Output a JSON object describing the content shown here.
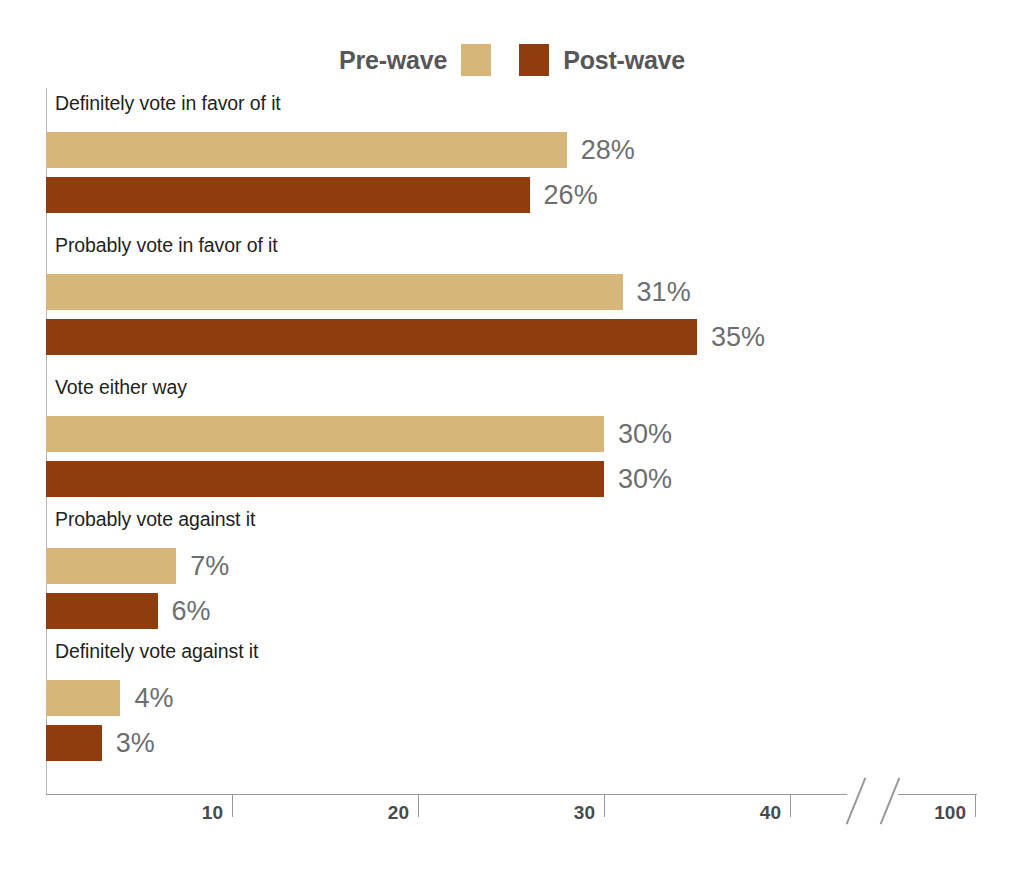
{
  "legend": {
    "pre_label": "Pre-wave",
    "post_label": "Post-wave",
    "pre_color": "#d6b679",
    "post_color": "#8f3d0e"
  },
  "chart_data": {
    "type": "bar",
    "orientation": "horizontal",
    "title": "",
    "xlabel": "",
    "ylabel": "",
    "grid": false,
    "legend_position": "top-center",
    "xlim": [
      0,
      100
    ],
    "axis_break": {
      "from": 42,
      "to": 96
    },
    "ticks": [
      10,
      20,
      30,
      40,
      100
    ],
    "tick_labels": [
      "10",
      "20",
      "30",
      "40",
      "100"
    ],
    "categories": [
      "Definitely vote in favor of it",
      "Probably vote in favor of it",
      "Vote either way",
      "Probably vote against it",
      "Definitely vote against it"
    ],
    "series": [
      {
        "name": "Pre-wave",
        "color": "#d6b679",
        "values": [
          28,
          31,
          30,
          7,
          4
        ],
        "value_labels": [
          "28%",
          "31%",
          "30%",
          "7%",
          "4%"
        ]
      },
      {
        "name": "Post-wave",
        "color": "#8f3d0e",
        "values": [
          26,
          35,
          30,
          6,
          3
        ],
        "value_labels": [
          "26%",
          "35%",
          "30%",
          "6%",
          "3%"
        ]
      }
    ]
  }
}
